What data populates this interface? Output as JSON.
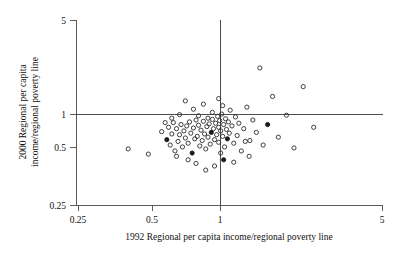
{
  "figure": {
    "width": 400,
    "height": 269,
    "background": "#ffffff",
    "point_color": "#2b2b2b",
    "axis_color": "#4a4a4a",
    "reference_line_color": "#3a3a3a"
  },
  "axes": {
    "x_title": "1992 Regional per capita income/regional poverty line",
    "y_title_line1": "2000 Regional per capita",
    "y_title_line2": "income/regional poverty line",
    "x_ticks": [
      "0.25",
      "0.5",
      "1",
      "5"
    ],
    "y_ticks": [
      "5",
      "1",
      "0.5",
      "0.25"
    ]
  },
  "chart_data": {
    "type": "scatter",
    "title": "",
    "xlabel": "1992 Regional per capita income/regional poverty line",
    "ylabel": "2000 Regional per capita income/regional poverty line",
    "xscale": "log",
    "yscale": "log",
    "xlim": [
      0.25,
      5
    ],
    "ylim": [
      0.25,
      5
    ],
    "xticks": [
      0.25,
      0.5,
      1,
      5
    ],
    "yticks": [
      0.25,
      0.5,
      1,
      5
    ],
    "grid": false,
    "legend": null,
    "reference_lines": [
      {
        "orientation": "horizontal",
        "value": 1.0
      },
      {
        "orientation": "vertical",
        "value": 1.0
      }
    ],
    "marker": "open circle",
    "series": [
      {
        "name": "regions",
        "points": [
          [
            0.41,
            0.62
          ],
          [
            0.5,
            0.57
          ],
          [
            0.57,
            0.82
          ],
          [
            0.6,
            0.72
          ],
          [
            0.61,
            0.88
          ],
          [
            0.62,
            0.66
          ],
          [
            0.63,
            0.79
          ],
          [
            0.64,
            0.95
          ],
          [
            0.65,
            0.6
          ],
          [
            0.66,
            0.86
          ],
          [
            0.67,
            0.7
          ],
          [
            0.68,
            0.78
          ],
          [
            0.69,
            0.92
          ],
          [
            0.7,
            0.64
          ],
          [
            0.71,
            0.83
          ],
          [
            0.72,
            0.74
          ],
          [
            0.73,
            0.9
          ],
          [
            0.74,
            0.68
          ],
          [
            0.75,
            0.96
          ],
          [
            0.76,
            0.8
          ],
          [
            0.77,
            0.58
          ],
          [
            0.78,
            0.87
          ],
          [
            0.79,
            0.73
          ],
          [
            0.8,
            0.99
          ],
          [
            0.81,
            0.76
          ],
          [
            0.82,
            0.91
          ],
          [
            0.83,
            0.65
          ],
          [
            0.84,
            0.84
          ],
          [
            0.85,
            0.71
          ],
          [
            0.86,
            0.97
          ],
          [
            0.87,
            0.79
          ],
          [
            0.88,
            0.62
          ],
          [
            0.89,
            0.89
          ],
          [
            0.9,
            0.75
          ],
          [
            0.9,
            1.02
          ],
          [
            0.91,
            0.93
          ],
          [
            0.92,
            0.67
          ],
          [
            0.93,
            0.81
          ],
          [
            0.94,
            1.0
          ],
          [
            0.95,
            0.86
          ],
          [
            0.96,
            0.72
          ],
          [
            0.97,
            0.94
          ],
          [
            0.98,
            0.78
          ],
          [
            0.99,
            1.05
          ],
          [
            1.0,
            0.88
          ],
          [
            1.0,
            0.69
          ],
          [
            1.01,
            0.98
          ],
          [
            1.02,
            0.83
          ],
          [
            1.03,
            1.09
          ],
          [
            1.04,
            0.76
          ],
          [
            1.05,
            0.92
          ],
          [
            1.06,
            0.64
          ],
          [
            1.07,
            1.01
          ],
          [
            1.08,
            0.85
          ],
          [
            1.09,
            0.73
          ],
          [
            1.1,
            0.96
          ],
          [
            1.11,
            0.8
          ],
          [
            1.12,
            1.16
          ],
          [
            1.14,
            0.9
          ],
          [
            1.16,
            0.68
          ],
          [
            1.18,
            1.04
          ],
          [
            1.2,
            0.77
          ],
          [
            1.22,
            0.94
          ],
          [
            1.25,
            0.6
          ],
          [
            1.28,
            0.86
          ],
          [
            1.32,
            1.22
          ],
          [
            1.36,
            0.71
          ],
          [
            1.4,
            0.99
          ],
          [
            1.45,
            0.81
          ],
          [
            1.5,
            2.3
          ],
          [
            1.55,
            0.66
          ],
          [
            1.62,
            0.92
          ],
          [
            1.7,
            1.45
          ],
          [
            1.8,
            0.75
          ],
          [
            1.95,
            1.07
          ],
          [
            2.1,
            0.63
          ],
          [
            2.3,
            1.7
          ],
          [
            2.55,
            0.88
          ],
          [
            0.72,
            1.35
          ],
          [
            0.78,
            1.18
          ],
          [
            0.86,
            1.28
          ],
          [
            0.94,
            1.12
          ],
          [
            1.0,
            1.4
          ],
          [
            1.04,
            1.25
          ],
          [
            0.68,
            1.08
          ],
          [
            0.82,
            1.06
          ],
          [
            0.88,
            0.44
          ],
          [
            0.96,
            0.47
          ],
          [
            1.05,
            0.52
          ],
          [
            1.16,
            0.5
          ],
          [
            0.74,
            0.52
          ],
          [
            0.8,
            0.49
          ],
          [
            1.35,
            0.55
          ],
          [
            0.66,
            0.55
          ],
          [
            0.63,
            1.02
          ],
          [
            1.02,
            0.58
          ],
          [
            1.3,
            0.7
          ],
          [
            0.59,
            0.95
          ]
        ]
      }
    ],
    "n_points": 100
  }
}
